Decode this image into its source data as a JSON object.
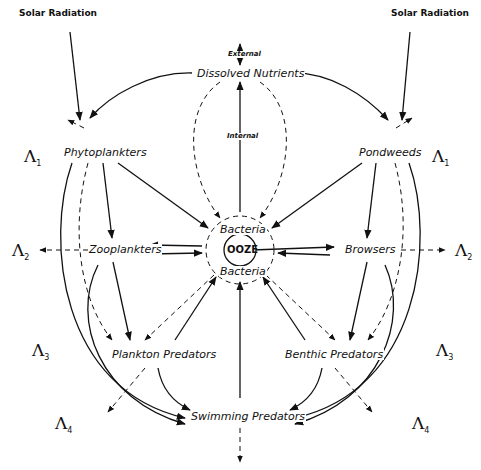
{
  "diagram": {
    "sources": {
      "solar_left": "Solar Radiation",
      "solar_right": "Solar Radiation",
      "external": "External",
      "internal": "Internal"
    },
    "nodes": {
      "dissolved_nutrients": "Dissolved Nutrients",
      "phytoplankters": "Phytoplankters",
      "pondweeds": "Pondweeds",
      "zooplankters": "Zooplankters",
      "browsers": "Browsers",
      "bacteria_top": "Bacteria",
      "ooze": "OOZE",
      "bacteria_bottom": "Bacteria",
      "plankton_predators": "Plankton Predators",
      "benthic_predators": "Benthic Predators",
      "swimming_predators": "Swimming Predators"
    },
    "levels": {
      "left": [
        {
          "symbol": "Λ",
          "sub": "1"
        },
        {
          "symbol": "Λ",
          "sub": "2"
        },
        {
          "symbol": "Λ",
          "sub": "3"
        },
        {
          "symbol": "Λ",
          "sub": "4"
        }
      ],
      "right": [
        {
          "symbol": "Λ",
          "sub": "1"
        },
        {
          "symbol": "Λ",
          "sub": "2"
        },
        {
          "symbol": "Λ",
          "sub": "3"
        },
        {
          "symbol": "Λ",
          "sub": "4"
        }
      ]
    },
    "legend_line_styles": {
      "solid": "energy/food transfer",
      "dashed": "loss / decomposition"
    },
    "colors": {
      "ink": "#111111",
      "paper": "#ffffff"
    }
  }
}
